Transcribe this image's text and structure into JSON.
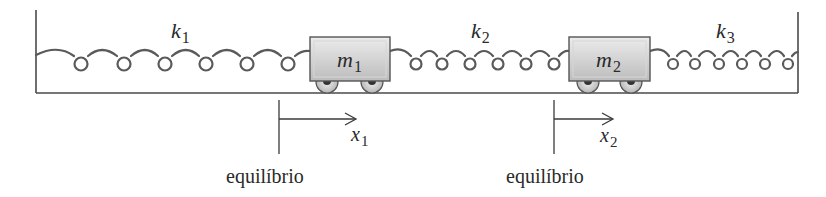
{
  "diagram": {
    "colors": {
      "line": "#4a4a4a",
      "spring": "#5a5a5a",
      "mass_fill_top": "#e6e6e6",
      "mass_fill_bottom": "#bdbdbd",
      "mass_stroke": "#555555",
      "wheel_fill": "#d8d8d8",
      "wheel_hub": "#333333",
      "text": "#2a2a2a"
    },
    "springs": [
      {
        "id": "k1",
        "label_main": "k",
        "label_sub": "1",
        "x_start": 36,
        "x_end": 310,
        "loops": 6
      },
      {
        "id": "k2",
        "label_main": "k",
        "label_sub": "2",
        "x_start": 390,
        "x_end": 569,
        "loops": 6
      },
      {
        "id": "k3",
        "label_main": "k",
        "label_sub": "3",
        "x_start": 650,
        "x_end": 798,
        "loops": 6
      }
    ],
    "masses": [
      {
        "id": "m1",
        "label_main": "m",
        "label_sub": "1"
      },
      {
        "id": "m2",
        "label_main": "m",
        "label_sub": "2"
      }
    ],
    "displacements": [
      {
        "id": "x1",
        "label_main": "x",
        "label_sub": "1",
        "equilibrium_label": "equilíbrio"
      },
      {
        "id": "x2",
        "label_main": "x",
        "label_sub": "2",
        "equilibrium_label": "equilíbrio"
      }
    ]
  }
}
